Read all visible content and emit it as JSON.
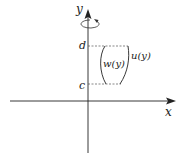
{
  "diagram": {
    "axes": {
      "x_label": "x",
      "y_label": "y"
    },
    "bounds": {
      "upper_label": "d",
      "lower_label": "c"
    },
    "curves": {
      "inner_label": "w(y)",
      "outer_label": "u(y)"
    },
    "rotation_icon": "rotate-around-y-axis-icon",
    "colors": {
      "line": "#222222",
      "dashed": "#555555"
    }
  }
}
